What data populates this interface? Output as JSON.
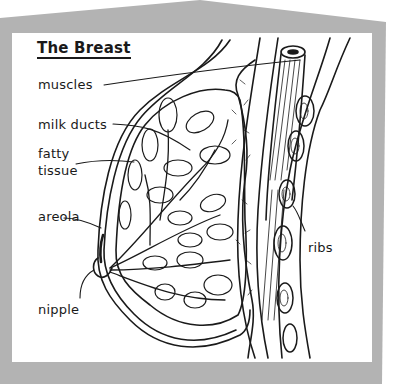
{
  "diagram": {
    "title": "The Breast",
    "labels": {
      "muscles": "muscles",
      "milk_ducts": "milk ducts",
      "fatty_tissue_line1": "fatty",
      "fatty_tissue_line2": "tissue",
      "areola": "areola",
      "nipple": "nipple",
      "ribs": "ribs"
    },
    "colors": {
      "frame": "#b3b3b3",
      "panel": "#ffffff",
      "ink": "#1a1a1a"
    }
  }
}
